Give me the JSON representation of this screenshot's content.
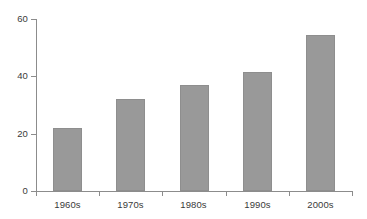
{
  "chart_data": {
    "type": "bar",
    "title": "",
    "subtitle": "",
    "xlabel": "",
    "ylabel": "",
    "categories": [
      "1960s",
      "1970s",
      "1980s",
      "1990s",
      "2000s"
    ],
    "values": [
      22,
      32,
      37,
      41.5,
      54.5
    ],
    "ylim": [
      0,
      60
    ],
    "yticks": [
      0,
      20,
      40,
      60
    ],
    "ytick_labels": [
      "0",
      "20",
      "40",
      "60"
    ],
    "grid": false,
    "legend": null,
    "legend_position": "none",
    "series": [
      {
        "name": "",
        "values": [
          22,
          32,
          37,
          41.5,
          54.5
        ]
      }
    ],
    "colors": {
      "bar_fill": "#999999",
      "bar_edge": "#8e8e8e",
      "axis": "#8c8c8c",
      "text": "#3a3a3a",
      "background": "#ffffff"
    }
  }
}
